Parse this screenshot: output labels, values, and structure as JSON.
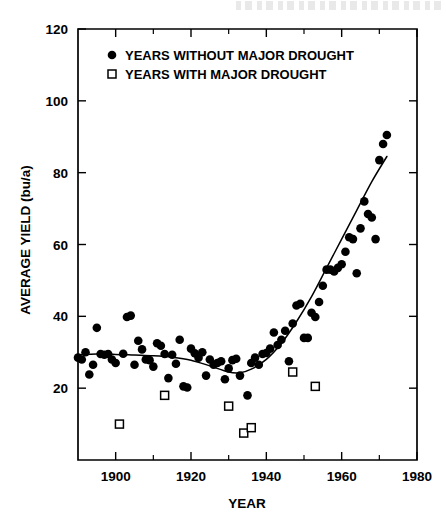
{
  "chart_data": {
    "type": "scatter",
    "title": "",
    "xlabel": "YEAR",
    "ylabel": "AVERAGE YIELD (bu/a)",
    "xlim": [
      1890,
      1980
    ],
    "ylim": [
      0,
      120
    ],
    "xticks": [
      1900,
      1920,
      1940,
      1960,
      1980
    ],
    "xtick_labels": [
      "1900",
      "1920",
      "1940",
      "1960",
      "1980"
    ],
    "xticks_minor": [
      1890,
      1910,
      1930,
      1950,
      1970
    ],
    "yticks": [
      20,
      40,
      60,
      80,
      100,
      120
    ],
    "ytick_labels": [
      "20",
      "40",
      "60",
      "80",
      "100",
      "120"
    ],
    "grid": false,
    "legend_position": "top-left-inside",
    "series": [
      {
        "name": "YEARS WITHOUT MAJOR DROUGHT",
        "marker": "filled-circle",
        "color": "#000000",
        "points": [
          [
            1890,
            28.5
          ],
          [
            1891,
            28.0
          ],
          [
            1892,
            30.0
          ],
          [
            1893,
            23.8
          ],
          [
            1894,
            26.5
          ],
          [
            1895,
            36.8
          ],
          [
            1896,
            29.5
          ],
          [
            1897,
            29.3
          ],
          [
            1898,
            29.5
          ],
          [
            1899,
            28.0
          ],
          [
            1900,
            27.0
          ],
          [
            1902,
            29.6
          ],
          [
            1903,
            39.8
          ],
          [
            1904,
            40.2
          ],
          [
            1905,
            26.5
          ],
          [
            1906,
            33.2
          ],
          [
            1907,
            30.8
          ],
          [
            1908,
            28.0
          ],
          [
            1909,
            27.8
          ],
          [
            1910,
            26.0
          ],
          [
            1911,
            32.5
          ],
          [
            1912,
            31.8
          ],
          [
            1913,
            29.5
          ],
          [
            1914,
            22.8
          ],
          [
            1915,
            29.3
          ],
          [
            1916,
            26.8
          ],
          [
            1917,
            33.5
          ],
          [
            1918,
            20.5
          ],
          [
            1919,
            20.2
          ],
          [
            1920,
            31.0
          ],
          [
            1921,
            29.7
          ],
          [
            1922,
            28.5
          ],
          [
            1923,
            30.0
          ],
          [
            1924,
            23.5
          ],
          [
            1925,
            28.0
          ],
          [
            1926,
            26.5
          ],
          [
            1927,
            27.0
          ],
          [
            1928,
            27.5
          ],
          [
            1929,
            22.5
          ],
          [
            1930,
            25.5
          ],
          [
            1931,
            27.8
          ],
          [
            1932,
            28.2
          ],
          [
            1933,
            23.5
          ],
          [
            1935,
            18.0
          ],
          [
            1936,
            27.0
          ],
          [
            1937,
            28.5
          ],
          [
            1938,
            26.5
          ],
          [
            1939,
            29.5
          ],
          [
            1940,
            29.8
          ],
          [
            1941,
            31.0
          ],
          [
            1942,
            35.5
          ],
          [
            1943,
            32.0
          ],
          [
            1944,
            33.5
          ],
          [
            1945,
            36.0
          ],
          [
            1946,
            27.5
          ],
          [
            1947,
            38.0
          ],
          [
            1948,
            43.0
          ],
          [
            1949,
            43.5
          ],
          [
            1950,
            34.0
          ],
          [
            1951,
            34.0
          ],
          [
            1952,
            41.0
          ],
          [
            1953,
            39.8
          ],
          [
            1954,
            44.0
          ],
          [
            1955,
            48.5
          ],
          [
            1956,
            53.0
          ],
          [
            1957,
            53.0
          ],
          [
            1958,
            52.5
          ],
          [
            1959,
            53.5
          ],
          [
            1960,
            54.5
          ],
          [
            1961,
            58.0
          ],
          [
            1962,
            62.0
          ],
          [
            1963,
            61.5
          ],
          [
            1964,
            52.0
          ],
          [
            1965,
            64.5
          ],
          [
            1966,
            72.0
          ],
          [
            1967,
            68.5
          ],
          [
            1968,
            67.5
          ],
          [
            1969,
            61.5
          ],
          [
            1970,
            83.5
          ],
          [
            1971,
            88.0
          ],
          [
            1972,
            90.5
          ]
        ]
      },
      {
        "name": "YEARS WITH MAJOR DROUGHT",
        "marker": "open-square",
        "color": "#000000",
        "points": [
          [
            1901,
            10.0
          ],
          [
            1913,
            18.0
          ],
          [
            1930,
            15.0
          ],
          [
            1934,
            7.5
          ],
          [
            1936,
            9.0
          ],
          [
            1947,
            24.5
          ],
          [
            1953,
            20.5
          ]
        ]
      }
    ],
    "trend_line": {
      "name": "fitted-trend",
      "points": [
        [
          1890,
          29.3
        ],
        [
          1895,
          29.5
        ],
        [
          1900,
          29.4
        ],
        [
          1905,
          29.2
        ],
        [
          1910,
          29.0
        ],
        [
          1915,
          28.6
        ],
        [
          1920,
          27.8
        ],
        [
          1925,
          26.2
        ],
        [
          1930,
          24.5
        ],
        [
          1933,
          24.3
        ],
        [
          1936,
          25.3
        ],
        [
          1940,
          28.0
        ],
        [
          1944,
          32.5
        ],
        [
          1948,
          38.5
        ],
        [
          1952,
          45.5
        ],
        [
          1956,
          53.5
        ],
        [
          1960,
          61.5
        ],
        [
          1964,
          69.5
        ],
        [
          1968,
          77.5
        ],
        [
          1972,
          84.5
        ]
      ]
    },
    "legend": [
      {
        "marker": "filled-circle",
        "label": "YEARS WITHOUT MAJOR DROUGHT"
      },
      {
        "marker": "open-square",
        "label": "YEARS WITH MAJOR DROUGHT"
      }
    ]
  }
}
